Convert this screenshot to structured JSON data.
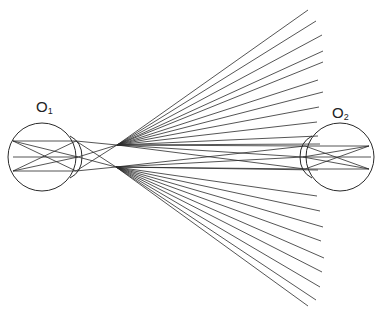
{
  "diagram": {
    "labels": {
      "left_eye": {
        "main": "O",
        "sub": "1",
        "x": 36,
        "y": 99
      },
      "right_eye": {
        "main": "O",
        "sub": "2",
        "x": 332,
        "y": 105
      }
    },
    "colors": {
      "line": "#2a2a2a",
      "background": "#ffffff"
    },
    "left_eye": {
      "center": [
        42,
        157
      ],
      "radius": 34,
      "cornea": {
        "top": [
          70,
          136
        ],
        "apex": [
          82,
          157
        ],
        "bottom": [
          70,
          178
        ]
      },
      "retina_points": [
        [
          13,
          141
        ],
        [
          13,
          157
        ],
        [
          13,
          171
        ]
      ],
      "lens_points": [
        [
          76,
          141
        ],
        [
          78,
          157
        ],
        [
          76,
          171
        ]
      ]
    },
    "right_eye": {
      "center": [
        340,
        157
      ],
      "radius": 34,
      "cornea": {
        "top": [
          312,
          136
        ],
        "apex": [
          300,
          157
        ],
        "bottom": [
          312,
          178
        ]
      },
      "retina_points": [
        [
          369,
          146
        ],
        [
          371,
          157
        ],
        [
          369,
          169
        ]
      ],
      "lens_points": [
        [
          305,
          146
        ],
        [
          303,
          157
        ],
        [
          305,
          169
        ]
      ]
    },
    "fan_origins": {
      "upper": [
        117,
        145
      ],
      "lower": [
        116,
        167
      ]
    },
    "upper_fan_endpoints": [
      [
        308,
        10
      ],
      [
        316,
        21
      ],
      [
        322,
        35
      ],
      [
        323,
        51
      ],
      [
        323,
        62
      ],
      [
        318,
        80
      ],
      [
        323,
        92
      ],
      [
        319,
        107
      ],
      [
        317,
        122
      ],
      [
        318,
        136
      ],
      [
        320,
        144
      ]
    ],
    "lower_fan_endpoints": [
      [
        318,
        170
      ],
      [
        317,
        196
      ],
      [
        320,
        211
      ],
      [
        323,
        227
      ],
      [
        321,
        241
      ],
      [
        324,
        258
      ],
      [
        322,
        272
      ],
      [
        320,
        287
      ],
      [
        316,
        300
      ],
      [
        308,
        306
      ]
    ],
    "connecting_rays": [
      [
        [
          13,
          141
        ],
        [
          76,
          141
        ]
      ],
      [
        [
          13,
          171
        ],
        [
          76,
          171
        ]
      ],
      [
        [
          13,
          141
        ],
        [
          76,
          171
        ]
      ],
      [
        [
          13,
          171
        ],
        [
          76,
          141
        ]
      ],
      [
        [
          13,
          157
        ],
        [
          78,
          157
        ]
      ],
      [
        [
          13,
          141
        ],
        [
          78,
          157
        ]
      ],
      [
        [
          13,
          171
        ],
        [
          78,
          157
        ]
      ],
      [
        [
          76,
          141
        ],
        [
          117,
          145
        ]
      ],
      [
        [
          76,
          171
        ],
        [
          116,
          167
        ]
      ],
      [
        [
          76,
          141
        ],
        [
          116,
          167
        ]
      ],
      [
        [
          76,
          171
        ],
        [
          117,
          145
        ]
      ],
      [
        [
          78,
          157
        ],
        [
          117,
          145
        ]
      ],
      [
        [
          78,
          157
        ],
        [
          116,
          167
        ]
      ],
      [
        [
          117,
          145
        ],
        [
          305,
          169
        ]
      ],
      [
        [
          116,
          167
        ],
        [
          305,
          146
        ]
      ],
      [
        [
          117,
          145
        ],
        [
          303,
          157
        ]
      ],
      [
        [
          116,
          167
        ],
        [
          303,
          157
        ]
      ],
      [
        [
          117,
          145
        ],
        [
          305,
          146
        ]
      ],
      [
        [
          116,
          167
        ],
        [
          305,
          169
        ]
      ],
      [
        [
          305,
          146
        ],
        [
          369,
          146
        ]
      ],
      [
        [
          305,
          169
        ],
        [
          369,
          169
        ]
      ],
      [
        [
          305,
          146
        ],
        [
          369,
          169
        ]
      ],
      [
        [
          305,
          169
        ],
        [
          369,
          146
        ]
      ],
      [
        [
          303,
          157
        ],
        [
          371,
          157
        ]
      ],
      [
        [
          303,
          157
        ],
        [
          369,
          146
        ]
      ],
      [
        [
          303,
          157
        ],
        [
          369,
          169
        ]
      ]
    ]
  }
}
